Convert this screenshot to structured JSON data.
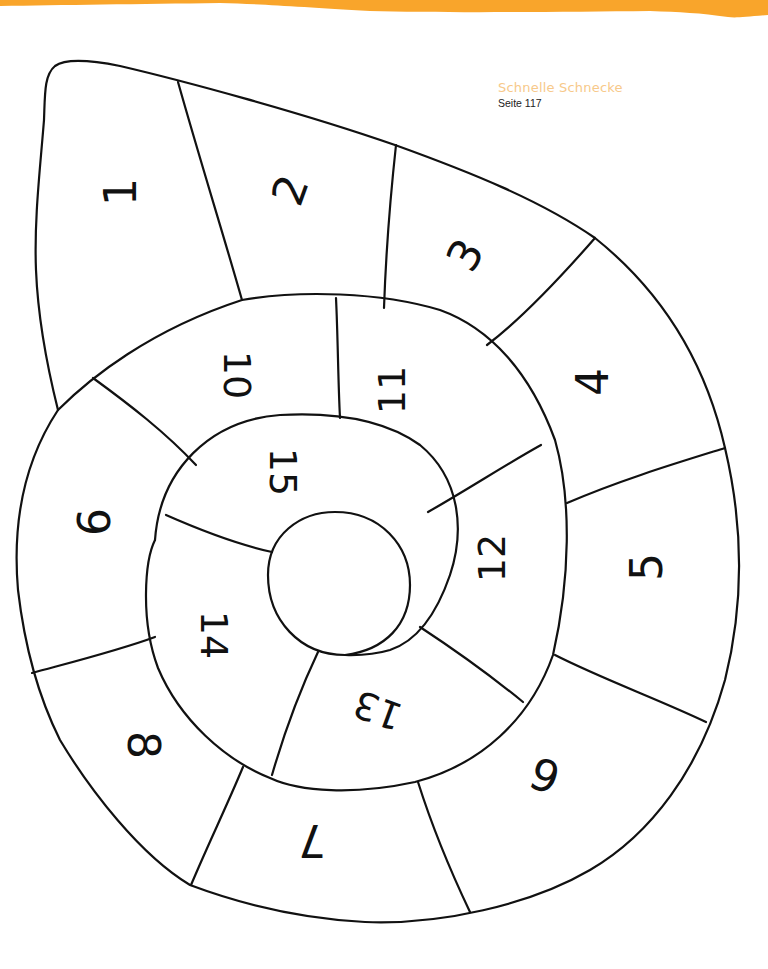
{
  "header": {
    "banner_color": "#f9a52b",
    "title": "Schnelle Schnecke",
    "title_color": "#f7c98a",
    "page_ref": "Seite 117"
  },
  "snail": {
    "line_color": "#111111",
    "segments": [
      {
        "id": 1,
        "label": "1",
        "x": 120,
        "y": 192,
        "rotate": -90
      },
      {
        "id": 2,
        "label": "2",
        "x": 290,
        "y": 190,
        "rotate": -70
      },
      {
        "id": 3,
        "label": "3",
        "x": 465,
        "y": 255,
        "rotate": -60
      },
      {
        "id": 4,
        "label": "4",
        "x": 592,
        "y": 382,
        "rotate": -90
      },
      {
        "id": 5,
        "label": "5",
        "x": 646,
        "y": 567,
        "rotate": -90
      },
      {
        "id": 6,
        "label": "6",
        "x": 545,
        "y": 775,
        "rotate": 200
      },
      {
        "id": 7,
        "label": "7",
        "x": 312,
        "y": 840,
        "rotate": 180
      },
      {
        "id": 8,
        "label": "8",
        "x": 143,
        "y": 745,
        "rotate": 90
      },
      {
        "id": 9,
        "label": "9",
        "x": 92,
        "y": 522,
        "rotate": 90
      },
      {
        "id": 10,
        "label": "10",
        "x": 237,
        "y": 375,
        "rotate": 90
      },
      {
        "id": 11,
        "label": "11",
        "x": 392,
        "y": 390,
        "rotate": -90
      },
      {
        "id": 12,
        "label": "12",
        "x": 492,
        "y": 558,
        "rotate": -90
      },
      {
        "id": 13,
        "label": "13",
        "x": 378,
        "y": 710,
        "rotate": 200
      },
      {
        "id": 14,
        "label": "14",
        "x": 214,
        "y": 635,
        "rotate": 90
      },
      {
        "id": 15,
        "label": "15",
        "x": 283,
        "y": 472,
        "rotate": 90
      }
    ]
  }
}
